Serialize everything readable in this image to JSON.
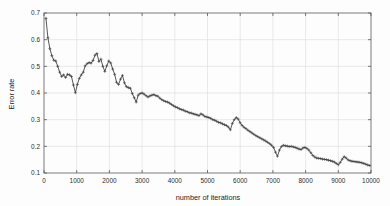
{
  "chart_data": {
    "type": "line",
    "title": "",
    "xlabel": "number of iterations",
    "ylabel": "Error rate",
    "xlim": [
      0,
      10000
    ],
    "ylim": [
      0.1,
      0.7
    ],
    "xticks": [
      0,
      1000,
      2000,
      3000,
      4000,
      5000,
      6000,
      7000,
      8000,
      9000,
      10000
    ],
    "xtick_labels": [
      "0",
      "1000",
      "2000",
      "3000",
      "4000",
      "5000",
      "6000",
      "7000",
      "8000",
      "9000",
      "10000"
    ],
    "yticks": [
      0.1,
      0.2,
      0.3,
      0.4,
      0.5,
      0.6,
      0.7
    ],
    "ytick_labels": [
      "0.1",
      "0.2",
      "0.3",
      "0.4",
      "0.5",
      "0.6",
      "0.7"
    ],
    "grid": true,
    "legend": null,
    "marker": "plus",
    "line_color": "#3a3a3a",
    "grid_color": "#dcdcdc",
    "axis_color": "#5a5a5a",
    "series": [
      {
        "name": "error rate",
        "x": [
          60,
          120,
          180,
          240,
          300,
          360,
          420,
          480,
          540,
          600,
          660,
          720,
          780,
          840,
          900,
          960,
          1020,
          1080,
          1140,
          1200,
          1260,
          1320,
          1380,
          1440,
          1500,
          1560,
          1620,
          1680,
          1740,
          1800,
          1860,
          1920,
          1980,
          2040,
          2100,
          2160,
          2220,
          2280,
          2340,
          2400,
          2460,
          2520,
          2580,
          2640,
          2700,
          2760,
          2820,
          2880,
          2940,
          3000,
          3060,
          3120,
          3180,
          3240,
          3300,
          3360,
          3420,
          3480,
          3540,
          3600,
          3660,
          3720,
          3780,
          3840,
          3900,
          3960,
          4020,
          4080,
          4140,
          4200,
          4260,
          4320,
          4380,
          4440,
          4500,
          4560,
          4620,
          4680,
          4740,
          4800,
          4860,
          4920,
          4980,
          5040,
          5100,
          5160,
          5220,
          5280,
          5340,
          5400,
          5460,
          5520,
          5580,
          5640,
          5700,
          5760,
          5820,
          5880,
          5940,
          6000,
          6060,
          6120,
          6180,
          6240,
          6300,
          6360,
          6420,
          6480,
          6540,
          6600,
          6660,
          6720,
          6780,
          6840,
          6900,
          6960,
          7020,
          7080,
          7140,
          7200,
          7260,
          7320,
          7380,
          7440,
          7500,
          7560,
          7620,
          7680,
          7740,
          7800,
          7860,
          7920,
          7980,
          8040,
          8100,
          8160,
          8220,
          8280,
          8340,
          8400,
          8460,
          8520,
          8580,
          8640,
          8700,
          8760,
          8820,
          8880,
          8940,
          9000,
          9060,
          9120,
          9180,
          9240,
          9300,
          9360,
          9420,
          9480,
          9540,
          9600,
          9660,
          9720,
          9780,
          9840,
          9900,
          9960
        ],
        "y": [
          0.68,
          0.607,
          0.566,
          0.54,
          0.523,
          0.52,
          0.5,
          0.478,
          0.462,
          0.468,
          0.458,
          0.47,
          0.468,
          0.462,
          0.43,
          0.401,
          0.432,
          0.455,
          0.468,
          0.478,
          0.502,
          0.51,
          0.514,
          0.512,
          0.522,
          0.542,
          0.548,
          0.518,
          0.527,
          0.5,
          0.481,
          0.502,
          0.52,
          0.513,
          0.49,
          0.47,
          0.44,
          0.432,
          0.452,
          0.466,
          0.438,
          0.424,
          0.42,
          0.418,
          0.398,
          0.382,
          0.366,
          0.392,
          0.398,
          0.4,
          0.396,
          0.39,
          0.385,
          0.389,
          0.392,
          0.394,
          0.39,
          0.388,
          0.381,
          0.375,
          0.371,
          0.368,
          0.366,
          0.362,
          0.357,
          0.352,
          0.348,
          0.345,
          0.341,
          0.338,
          0.336,
          0.332,
          0.33,
          0.326,
          0.325,
          0.322,
          0.32,
          0.318,
          0.315,
          0.322,
          0.318,
          0.312,
          0.31,
          0.308,
          0.305,
          0.3,
          0.298,
          0.294,
          0.29,
          0.288,
          0.284,
          0.281,
          0.278,
          0.272,
          0.262,
          0.286,
          0.3,
          0.308,
          0.302,
          0.288,
          0.278,
          0.271,
          0.266,
          0.26,
          0.255,
          0.25,
          0.245,
          0.24,
          0.236,
          0.232,
          0.228,
          0.224,
          0.22,
          0.215,
          0.21,
          0.204,
          0.196,
          0.178,
          0.163,
          0.186,
          0.199,
          0.204,
          0.202,
          0.201,
          0.199,
          0.2,
          0.198,
          0.196,
          0.193,
          0.19,
          0.188,
          0.194,
          0.196,
          0.192,
          0.186,
          0.176,
          0.166,
          0.16,
          0.156,
          0.155,
          0.154,
          0.152,
          0.151,
          0.15,
          0.148,
          0.146,
          0.144,
          0.141,
          0.136,
          0.131,
          0.14,
          0.152,
          0.161,
          0.156,
          0.149,
          0.146,
          0.144,
          0.143,
          0.142,
          0.141,
          0.14,
          0.138,
          0.136,
          0.133,
          0.13,
          0.128
        ]
      }
    ]
  },
  "figure": {
    "xlabel": "number of iterations",
    "ylabel": "Error rate"
  }
}
